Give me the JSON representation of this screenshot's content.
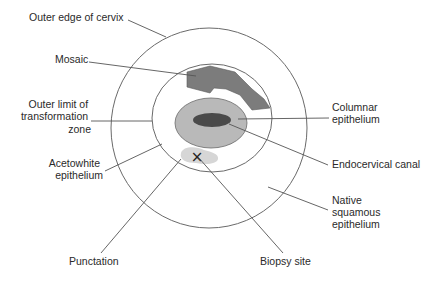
{
  "colors": {
    "background": "#ffffff",
    "outline": "#6a6a6a",
    "leader": "#555555",
    "mosaic": "#7c7c7c",
    "columnar": "#b9b9b9",
    "canal": "#4a4a4a",
    "punctation": "#d6d6d6",
    "text": "#2a2a2a"
  },
  "labels": {
    "outer_edge": {
      "lines": [
        "Outer edge of cervix"
      ]
    },
    "mosaic": {
      "lines": [
        "Mosaic"
      ]
    },
    "outer_limit": {
      "lines": [
        "Outer limit of",
        "transformation",
        "zone"
      ]
    },
    "acetowhite": {
      "lines": [
        "Acetowhite",
        "epithelium"
      ]
    },
    "punctation": {
      "lines": [
        "Punctation"
      ]
    },
    "columnar": {
      "lines": [
        "Columnar",
        "epithelium"
      ]
    },
    "endocervical": {
      "lines": [
        "Endocervical canal"
      ]
    },
    "native": {
      "lines": [
        "Native",
        "squamous",
        "epithelium"
      ]
    },
    "biopsy": {
      "lines": [
        "Biopsy site"
      ]
    }
  },
  "markers": {
    "biopsy_mark": "×"
  }
}
